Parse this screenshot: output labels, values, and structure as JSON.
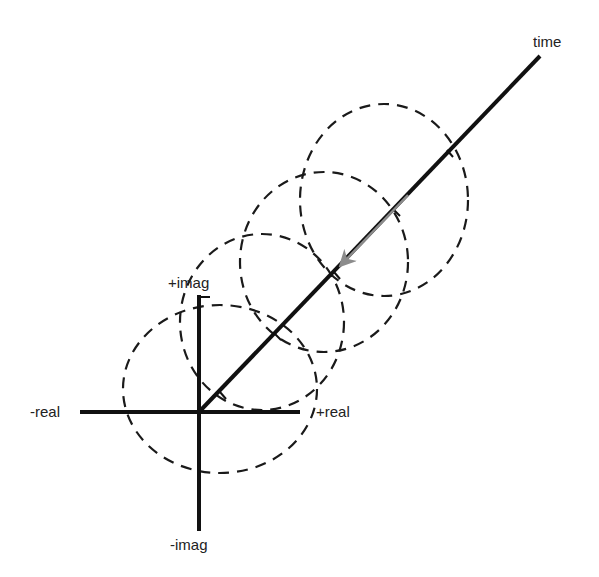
{
  "diagram": {
    "labels": {
      "time": "time",
      "pos_imag": "+imag",
      "neg_imag": "-imag",
      "neg_real": "-real",
      "pos_real": "+real"
    },
    "colors": {
      "axis": "#111111",
      "dashed_circle": "#1a1a1a",
      "arrow": "#8c8c8c",
      "text": "#222222",
      "background": "#ffffff"
    }
  }
}
